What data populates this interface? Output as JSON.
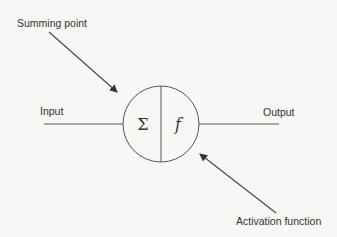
{
  "diagram": {
    "labels": {
      "summing_point": "Summing point",
      "input": "Input",
      "output": "Output",
      "activation_function": "Activation function"
    },
    "node": {
      "left_symbol": "Σ",
      "right_symbol": "f"
    },
    "colors": {
      "background": "#f7f7f5",
      "stroke": "#555555",
      "text": "#333333"
    }
  }
}
